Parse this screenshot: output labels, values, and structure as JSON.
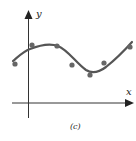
{
  "chart_data": {
    "type": "scatter",
    "title": "",
    "caption": "(c)",
    "xlabel": "x",
    "ylabel": "y",
    "grid": false,
    "legend": null,
    "points": [
      {
        "x": 15,
        "y": 64
      },
      {
        "x": 32,
        "y": 45
      },
      {
        "x": 57,
        "y": 46
      },
      {
        "x": 72,
        "y": 65
      },
      {
        "x": 90,
        "y": 75
      },
      {
        "x": 104,
        "y": 63
      },
      {
        "x": 130,
        "y": 47
      }
    ],
    "curve_path": "M13,61 C20,55 24,51 30,49 C40,45 50,43 58,46 C68,50 76,63 86,70 C92,74 98,73 106,67 C116,59 124,51 132,42",
    "colors": {
      "curve": "#555555",
      "points": "#666666",
      "axes": "#333333"
    }
  }
}
